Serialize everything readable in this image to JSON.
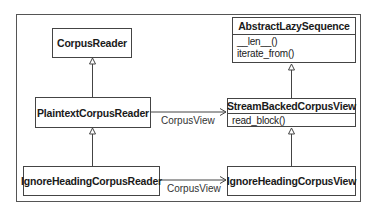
{
  "diagram": {
    "type": "uml-class-diagram",
    "classes": {
      "corpus_reader": {
        "name": "CorpusReader"
      },
      "abstract_lazy_sequence": {
        "name": "AbstractLazySequence",
        "methods": [
          "__len__()",
          "iterate_from()"
        ]
      },
      "plaintext_corpus_reader": {
        "name": "PlaintextCorpusReader"
      },
      "stream_backed_corpus_view": {
        "name": "StreamBackedCorpusView",
        "methods": [
          "read_block()"
        ]
      },
      "ignore_heading_corpus_reader": {
        "name": "IgnoreHeadingCorpusReader"
      },
      "ignore_heading_corpus_view": {
        "name": "IgnoreHeadingCorpusView"
      }
    },
    "relations": [
      {
        "from": "PlaintextCorpusReader",
        "to": "CorpusReader",
        "kind": "inheritance"
      },
      {
        "from": "IgnoreHeadingCorpusReader",
        "to": "PlaintextCorpusReader",
        "kind": "inheritance"
      },
      {
        "from": "StreamBackedCorpusView",
        "to": "AbstractLazySequence",
        "kind": "inheritance"
      },
      {
        "from": "IgnoreHeadingCorpusView",
        "to": "StreamBackedCorpusView",
        "kind": "inheritance"
      },
      {
        "from": "PlaintextCorpusReader",
        "to": "StreamBackedCorpusView",
        "kind": "association",
        "label": "CorpusView"
      },
      {
        "from": "IgnoreHeadingCorpusReader",
        "to": "IgnoreHeadingCorpusView",
        "kind": "association",
        "label": "CorpusView"
      }
    ],
    "edge_labels": {
      "top": "CorpusView",
      "bottom": "CorpusView"
    }
  }
}
